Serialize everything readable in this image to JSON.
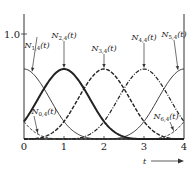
{
  "chart_data": {
    "type": "line",
    "title": "",
    "xlabel": "t",
    "ylabel": "",
    "xlim": [
      0,
      4
    ],
    "ylim": [
      0,
      1.2
    ],
    "x_ticks": [
      "0",
      "1",
      "2",
      "3",
      "4"
    ],
    "y_ticks": [
      {
        "value": 1.0,
        "label": "1.0"
      }
    ],
    "grid": false,
    "legend": "none (curves labeled directly with arrows)",
    "axis_arrow_label": "t",
    "series": [
      {
        "name": "N0,4(t)",
        "label_main": "N",
        "label_sub": "0,4",
        "label_tail": "(t)",
        "center": -1,
        "style": "dashed-fine",
        "peak": 0.6667,
        "label_anchor_t": 0.35,
        "label_pos": "lower-left"
      },
      {
        "name": "N1,4(t)",
        "label_main": "N",
        "label_sub": "1,4",
        "label_tail": "(t)",
        "center": 0,
        "style": "solid-thin",
        "peak": 0.6667,
        "label_anchor_t": 0.2,
        "label_pos": "top"
      },
      {
        "name": "N2,4(t)",
        "label_main": "N",
        "label_sub": "2,4",
        "label_tail": "(t)",
        "center": 1,
        "style": "solid-thick",
        "peak": 0.6667,
        "label_anchor_t": 1.0,
        "label_pos": "top"
      },
      {
        "name": "N3,4(t)",
        "label_main": "N",
        "label_sub": "3,4",
        "label_tail": "(t)",
        "center": 2,
        "style": "dashed",
        "peak": 0.6667,
        "label_anchor_t": 2.0,
        "label_pos": "top"
      },
      {
        "name": "N4,4(t)",
        "label_main": "N",
        "label_sub": "4,4",
        "label_tail": "(t)",
        "center": 3,
        "style": "dash-dot",
        "peak": 0.6667,
        "label_anchor_t": 3.0,
        "label_pos": "top"
      },
      {
        "name": "N5,4(t)",
        "label_main": "N",
        "label_sub": "5,4",
        "label_tail": "(t)",
        "center": 4,
        "style": "solid-thin",
        "peak": 0.6667,
        "label_anchor_t": 3.85,
        "label_pos": "top"
      },
      {
        "name": "N6,4(t)",
        "label_main": "N",
        "label_sub": "6,4",
        "label_tail": "(t)",
        "center": 5,
        "style": "dashed-fine",
        "peak": 0.6667,
        "label_anchor_t": 3.75,
        "label_pos": "lower-right"
      }
    ]
  }
}
